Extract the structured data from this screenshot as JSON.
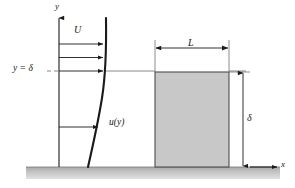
{
  "figure": {
    "type": "engineering-schematic",
    "background_color": "#ffffff",
    "line_color": "#1a1a1a",
    "thin_line_color": "#555555",
    "block_fill_color": "#c8c8c8",
    "block_stroke_color": "#4d4d4d",
    "ground_fill_top_color": "#b5b5b5",
    "ground_fill_bottom_color": "#d8d8d8"
  },
  "axes": {
    "y_label": "y",
    "x_label": "x",
    "origin": {
      "x": 59,
      "y": 167
    },
    "y_axis_top": {
      "x": 59,
      "y": 16
    },
    "x_axis_right": {
      "x": 279,
      "y": 167
    }
  },
  "labels": {
    "freestream_velocity": "U",
    "boundary_layer_edge": "y = δ",
    "velocity_profile": "u(y)",
    "plate_length": "L",
    "boundary_layer_thickness": "δ"
  },
  "velocity_arrows": [
    {
      "id": "arrow-1",
      "y": 44,
      "x_start": 59,
      "x_end": 104
    },
    {
      "id": "arrow-2",
      "y": 57,
      "x_start": 59,
      "x_end": 104
    },
    {
      "id": "arrow-3",
      "y": 71,
      "x_start": 59,
      "x_end": 104
    },
    {
      "id": "arrow-4",
      "y": 127,
      "x_start": 59,
      "x_end": 99
    }
  ],
  "delta_line": {
    "y": 71,
    "x_start": 48,
    "x_end": 245
  },
  "profile_curve": {
    "description": "u(y) boundary layer profile, zero at wall rising to U at y = delta",
    "top": {
      "x": 106,
      "y": 18
    },
    "bottom": {
      "x": 88,
      "y": 167
    }
  },
  "block": {
    "x": 155,
    "y": 72,
    "width": 74,
    "height": 95
  },
  "dimension_L": {
    "y": 48,
    "x_start": 155,
    "x_end": 229
  },
  "dimension_delta": {
    "x": 243,
    "y_start": 72,
    "y_end": 167
  },
  "ground": {
    "y": 167,
    "height": 12,
    "x_start": 26,
    "x_end": 280
  }
}
